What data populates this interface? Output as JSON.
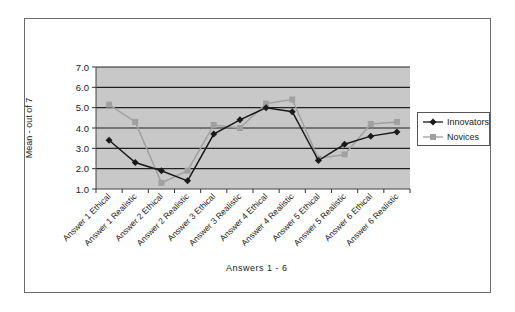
{
  "chart_data": {
    "type": "line",
    "title": "",
    "xlabel": "Answers 1 - 6",
    "ylabel": "Mean - out of 7",
    "ylim": [
      1.0,
      7.0
    ],
    "yticks": [
      "1.0",
      "2.0",
      "3.0",
      "4.0",
      "5.0",
      "6.0",
      "7.0"
    ],
    "grid": true,
    "legend_position": "right",
    "categories": [
      "Answer 1 Ethical",
      "Answer 1 Realistic",
      "Answer 2 Ethical",
      "Answer 2 Realistic",
      "Answer 3 Ethical",
      "Answer 3 Realistic",
      "Answer 4 Ethical",
      "Answer 4 Realistic",
      "Answer 5 Ethical",
      "Answer 5 Realistic",
      "Answer 6 Ethical",
      "Answer 6 Realistic"
    ],
    "series": [
      {
        "name": "Innovators",
        "color": "#1a1a1a",
        "marker": "diamond",
        "values": [
          3.4,
          2.3,
          1.9,
          1.4,
          3.7,
          4.4,
          5.0,
          4.8,
          2.4,
          3.2,
          3.6,
          3.8
        ]
      },
      {
        "name": "Novices",
        "color": "#a0a0a0",
        "marker": "square",
        "values": [
          5.15,
          4.3,
          1.3,
          1.9,
          4.15,
          4.0,
          5.2,
          5.4,
          2.5,
          2.7,
          4.2,
          4.3
        ]
      }
    ]
  },
  "colors": {
    "plot_background": "#c8c8c8",
    "gridline": "#222222",
    "frame": "#6a6a6a"
  }
}
